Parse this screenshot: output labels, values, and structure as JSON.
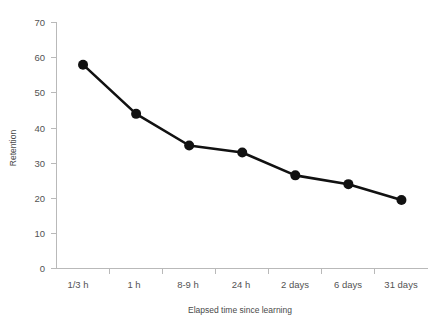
{
  "chart_data": {
    "type": "line",
    "title": "",
    "xlabel": "Elapsed time since learning",
    "ylabel": "Retention",
    "categories": [
      "1/3 h",
      "1 h",
      "8-9 h",
      "24 h",
      "2 days",
      "6 days",
      "31 days"
    ],
    "values": [
      58,
      44,
      35,
      33,
      26.5,
      24,
      19.5
    ],
    "series": [
      {
        "name": "Retention",
        "values": [
          58,
          44,
          35,
          33,
          26.5,
          24,
          19.5
        ]
      }
    ],
    "ylim": [
      0,
      70
    ],
    "yticks": [
      0,
      10,
      20,
      30,
      40,
      50,
      60,
      70
    ],
    "ytick_labels": [
      "0",
      "10",
      "20",
      "30",
      "40",
      "50",
      "60",
      "70"
    ],
    "grid": false,
    "legend": "none",
    "marker": "filled-circle",
    "line_color": "#111111",
    "marker_color": "#111111",
    "axis_color": "#b9b9b9",
    "background": "#ffffff"
  },
  "axes": {
    "y_title": "Retention",
    "x_title": "Elapsed time since learning"
  }
}
